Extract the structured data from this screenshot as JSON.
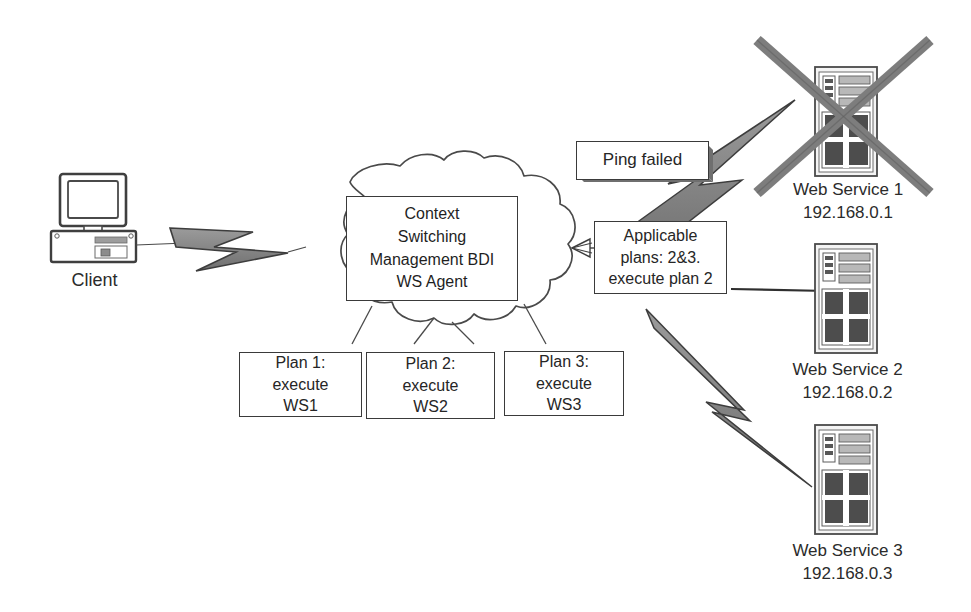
{
  "diagram": {
    "colors": {
      "stroke": "#3a3a3a",
      "text": "#262626",
      "bolt_fill": "#8a8a8a",
      "bolt_stroke": "#4a4a4a",
      "server_body": "#f2f2f2",
      "server_detail": "#4f4f4f",
      "cross_mark": "#7d7d7d",
      "background": "#ffffff"
    },
    "client": {
      "caption": "Client",
      "icon": "desktop-computer-icon"
    },
    "agent_cloud": {
      "icon": "cloud-shape",
      "box_text": "Context\nSwitching\nManagement BDI\nWS Agent"
    },
    "plans": [
      {
        "id": "plan-1",
        "text": "Plan 1:\nexecute\nWS1"
      },
      {
        "id": "plan-2",
        "text": "Plan 2:\nexecute\nWS2"
      },
      {
        "id": "plan-3",
        "text": "Plan 3:\nexecute\nWS3"
      }
    ],
    "ping_failed": {
      "text": "Ping failed"
    },
    "applicable_plans": {
      "text": "Applicable\nplans: 2&3.\nexecute plan 2"
    },
    "services": [
      {
        "id": "web-service-1",
        "name": "Web Service 1",
        "ip": "192.168.0.1",
        "caption": "Web Service 1\n192.168.0.1",
        "status": "failed",
        "marked_with_cross": true,
        "icon": "server-tower-icon"
      },
      {
        "id": "web-service-2",
        "name": "Web Service 2",
        "ip": "192.168.0.2",
        "caption": "Web Service 2\n192.168.0.2",
        "status": "available",
        "marked_with_cross": false,
        "icon": "server-tower-icon"
      },
      {
        "id": "web-service-3",
        "name": "Web Service 3",
        "ip": "192.168.0.3",
        "caption": "Web Service 3\n192.168.0.3",
        "status": "available",
        "marked_with_cross": false,
        "icon": "server-tower-icon"
      }
    ],
    "connectors": [
      {
        "id": "client-to-cloud",
        "type": "lightning-bolt-icon",
        "from": "client",
        "to": "agent_cloud"
      },
      {
        "id": "cloud-to-applicable-plans",
        "type": "arrow-line",
        "from": "applicable_plans",
        "to": "agent_cloud"
      },
      {
        "id": "applicable-plans-to-ws1",
        "type": "lightning-bolt-icon",
        "from": "applicable_plans",
        "to": "web-service-1"
      },
      {
        "id": "applicable-plans-to-ws2",
        "type": "plain-line",
        "from": "applicable_plans",
        "to": "web-service-2"
      },
      {
        "id": "applicable-plans-to-ws3",
        "type": "lightning-bolt-icon",
        "from": "applicable_plans",
        "to": "web-service-3"
      },
      {
        "id": "cloud-to-plan-1",
        "type": "plain-line",
        "from": "agent_cloud",
        "to": "plan-1"
      },
      {
        "id": "cloud-to-plan-2",
        "type": "plain-line",
        "from": "agent_cloud",
        "to": "plan-2"
      },
      {
        "id": "cloud-to-plan-3",
        "type": "plain-line",
        "from": "agent_cloud",
        "to": "plan-3"
      }
    ]
  }
}
